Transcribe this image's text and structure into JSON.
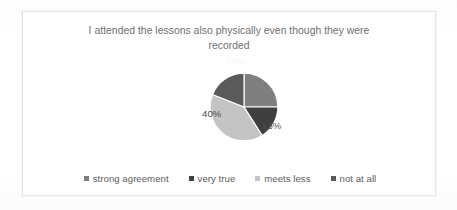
{
  "figure": {
    "title_line1": "I attended the lessons also physically even though they were",
    "title_line2": "recorded",
    "title_full": "I attended the lessons also physically even though they were recorded"
  },
  "labels": {
    "slice_light_gray": "40%",
    "slice_dark_right": "16%",
    "slice_medium_top_right": "25%"
  },
  "legend": {
    "items": [
      {
        "label": "strong agreement",
        "color": "#7f7f7f"
      },
      {
        "label": "very true",
        "color": "#3f3f3f"
      },
      {
        "label": "meets less",
        "color": "#c4c4c4"
      },
      {
        "label": "not at all",
        "color": "#5a5a5a"
      }
    ]
  },
  "chart_data": {
    "type": "pie",
    "title": "I attended the lessons also physically even though they were recorded",
    "xlabel": "",
    "ylabel": "",
    "legend_position": "bottom",
    "grid": false,
    "categories": [
      "strong agreement",
      "very true",
      "meets less",
      "not at all"
    ],
    "values": [
      25,
      16,
      40,
      19
    ],
    "unit": "%",
    "data_labels": [
      "25%",
      "16%",
      "40%",
      "19%"
    ],
    "visible_data_labels": [
      "40%",
      "16%"
    ],
    "colors": [
      "#7f7f7f",
      "#3f3f3f",
      "#c4c4c4",
      "#5a5a5a"
    ],
    "start_angle_deg": 0,
    "direction": "clockwise",
    "slices": [
      {
        "name": "strong agreement",
        "value": 25,
        "color": "#7f7f7f",
        "label": "25%",
        "label_visible": false
      },
      {
        "name": "very true",
        "value": 16,
        "color": "#3f3f3f",
        "label": "16%",
        "label_visible": true
      },
      {
        "name": "meets less",
        "value": 40,
        "color": "#c4c4c4",
        "label": "40%",
        "label_visible": true
      },
      {
        "name": "not at all",
        "value": 19,
        "color": "#5a5a5a",
        "label": "19%",
        "label_visible": false
      }
    ]
  }
}
